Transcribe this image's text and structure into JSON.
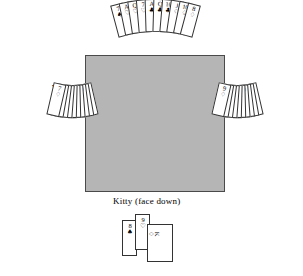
{
  "diagram": {
    "title_labels": {
      "north": "North",
      "west": "West",
      "east": "East",
      "kitty": "Kitty (face down)"
    },
    "table_color": "#b5b5b5",
    "table_border_color": "#4a4a4a"
  },
  "hands": {
    "north": {
      "label": "North",
      "cards": [
        {
          "rank": "7",
          "suit": "♠",
          "suit_name": "spades",
          "color": "black"
        },
        {
          "rank": "A",
          "suit": "♡",
          "suit_name": "hearts",
          "color": "black"
        },
        {
          "rank": "Q",
          "suit": "♡",
          "suit_name": "hearts",
          "color": "black"
        },
        {
          "rank": "7",
          "suit": "♡",
          "suit_name": "hearts",
          "color": "black"
        },
        {
          "rank": "A",
          "suit": "♣",
          "suit_name": "clubs",
          "color": "black"
        },
        {
          "rank": "Q",
          "suit": "♣",
          "suit_name": "clubs",
          "color": "black"
        },
        {
          "rank": "10",
          "suit": "♣",
          "suit_name": "clubs",
          "color": "black"
        },
        {
          "rank": "J",
          "suit": "♢",
          "suit_name": "diamonds",
          "color": "black"
        },
        {
          "rank": "10",
          "suit": "♢",
          "suit_name": "diamonds",
          "color": "black"
        },
        {
          "rank": "8",
          "suit": "♢",
          "suit_name": "diamonds",
          "color": "black"
        }
      ]
    },
    "west": {
      "label": "West",
      "cards": [
        {
          "rank": "JOKER",
          "suit": "",
          "suit_name": "joker",
          "color": "black",
          "is_joker": true
        },
        {
          "rank": "K",
          "suit": "♠",
          "suit_name": "spades",
          "color": "black"
        },
        {
          "rank": "10",
          "suit": "♠",
          "suit_name": "spades",
          "color": "black"
        },
        {
          "rank": "9",
          "suit": "♠",
          "suit_name": "spades",
          "color": "black"
        },
        {
          "rank": "K",
          "suit": "♡",
          "suit_name": "hearts",
          "color": "black"
        },
        {
          "rank": "J",
          "suit": "♡",
          "suit_name": "hearts",
          "color": "black"
        },
        {
          "rank": "8",
          "suit": "♡",
          "suit_name": "hearts",
          "color": "black"
        },
        {
          "rank": "7",
          "suit": "♣",
          "suit_name": "clubs",
          "color": "black"
        },
        {
          "rank": "A",
          "suit": "♢",
          "suit_name": "diamonds",
          "color": "black"
        },
        {
          "rank": "7",
          "suit": "♢",
          "suit_name": "diamonds",
          "color": "black"
        }
      ]
    },
    "east": {
      "label": "East",
      "cards": [
        {
          "rank": "A",
          "suit": "♠",
          "suit_name": "spades",
          "color": "black"
        },
        {
          "rank": "Q",
          "suit": "♠",
          "suit_name": "spades",
          "color": "black"
        },
        {
          "rank": "J",
          "suit": "♠",
          "suit_name": "spades",
          "color": "black"
        },
        {
          "rank": "10",
          "suit": "♡",
          "suit_name": "hearts",
          "color": "black"
        },
        {
          "rank": "K",
          "suit": "♣",
          "suit_name": "clubs",
          "color": "black"
        },
        {
          "rank": "J",
          "suit": "♣",
          "suit_name": "clubs",
          "color": "black"
        },
        {
          "rank": "9",
          "suit": "♣",
          "suit_name": "clubs",
          "color": "black"
        },
        {
          "rank": "8",
          "suit": "♣",
          "suit_name": "clubs",
          "color": "black"
        },
        {
          "rank": "Q",
          "suit": "♢",
          "suit_name": "diamonds",
          "color": "black"
        },
        {
          "rank": "9",
          "suit": "♢",
          "suit_name": "diamonds",
          "color": "black"
        }
      ]
    }
  },
  "kitty": {
    "label": "Kitty (face down)",
    "cards": [
      {
        "rank": "8",
        "suit": "♠",
        "suit_name": "spades",
        "color": "black",
        "orientation": "upright"
      },
      {
        "rank": "9",
        "suit": "♡",
        "suit_name": "hearts",
        "color": "black",
        "orientation": "upright"
      },
      {
        "rank": "K",
        "suit": "♢",
        "suit_name": "diamonds",
        "color": "black",
        "orientation": "sideways"
      }
    ]
  }
}
